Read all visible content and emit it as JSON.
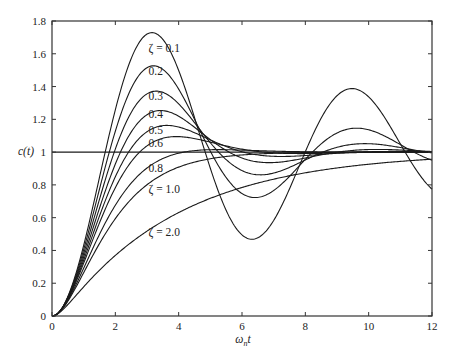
{
  "chart_data": {
    "type": "line",
    "title": "",
    "xlabel": "ωₙt",
    "ylabel": "c(t)",
    "xlim": [
      0,
      12
    ],
    "ylim": [
      0,
      1.8
    ],
    "grid": false,
    "legend": "inline labels on curves",
    "x_ticks": [
      "0",
      "2",
      "4",
      "6",
      "8",
      "10",
      "12"
    ],
    "y_ticks": [
      "0",
      "0.2",
      "0.4",
      "0.6",
      "0.8",
      "1",
      "1.2",
      "1.4",
      "1.6",
      "1.8"
    ],
    "reference_line": {
      "y": 1.0
    },
    "x": [
      0,
      1,
      2,
      3,
      4,
      5,
      6,
      7,
      8,
      9,
      10,
      11,
      12
    ],
    "series": [
      {
        "name": "ζ = 0.1",
        "zeta": 0.1,
        "label": "ζ = 0.1",
        "values": [
          0,
          0.431,
          1.258,
          1.72,
          1.499,
          0.902,
          0.494,
          0.581,
          0.997,
          1.341,
          1.339,
          1.052,
          0.774
        ]
      },
      {
        "name": "ζ = 0.2",
        "zeta": 0.2,
        "label": "0.2",
        "values": [
          0,
          0.405,
          1.128,
          1.516,
          1.385,
          1.005,
          0.747,
          0.766,
          0.957,
          1.117,
          1.136,
          1.046,
          0.95
        ]
      },
      {
        "name": "ζ = 0.3",
        "zeta": 0.3,
        "label": "0.3",
        "values": [
          0,
          0.382,
          1.018,
          1.355,
          1.295,
          1.057,
          0.888,
          0.873,
          0.952,
          1.03,
          1.051,
          1.027,
          0.995
        ]
      },
      {
        "name": "ζ = 0.4",
        "zeta": 0.4,
        "label": "0.4",
        "values": [
          0,
          0.36,
          0.927,
          1.228,
          1.219,
          1.075,
          0.964,
          0.937,
          0.964,
          0.999,
          1.016,
          1.013,
          1.004
        ]
      },
      {
        "name": "ζ = 0.5",
        "zeta": 0.5,
        "label": "0.5",
        "values": [
          0,
          0.34,
          0.849,
          1.125,
          1.153,
          1.075,
          1.002,
          0.974,
          0.979,
          0.993,
          1.002,
          1.003,
          1.001
        ]
      },
      {
        "name": "ζ = 0.6",
        "zeta": 0.6,
        "label": "0.6",
        "values": [
          0,
          0.322,
          0.784,
          1.038,
          1.095,
          1.061,
          1.018,
          0.995,
          0.991,
          0.995,
          1.0,
          1.001,
          1.0
        ]
      },
      {
        "name": "ζ = 0.8",
        "zeta": 0.8,
        "label": "0.8",
        "values": [
          0,
          0.291,
          0.675,
          0.903,
          0.993,
          1.015,
          1.012,
          1.005,
          1.001,
          1.0,
          1.0,
          1.0,
          1.0
        ]
      },
      {
        "name": "ζ = 1.0",
        "zeta": 1.0,
        "label": "ζ = 1.0",
        "values": [
          0,
          0.264,
          0.594,
          0.801,
          0.908,
          0.96,
          0.983,
          0.993,
          0.997,
          0.999,
          1.0,
          1.0,
          1.0
        ]
      },
      {
        "name": "ζ = 2.0",
        "zeta": 2.0,
        "label": "ζ = 2.0",
        "values": [
          0,
          0.178,
          0.37,
          0.517,
          0.63,
          0.718,
          0.785,
          0.835,
          0.874,
          0.903,
          0.926,
          0.943,
          0.957
        ]
      }
    ],
    "curve_labels": [
      {
        "text": "ζ = 0.1",
        "x": 3.05,
        "y": 1.61
      },
      {
        "text": "0.2",
        "x": 3.05,
        "y": 1.47
      },
      {
        "text": "0.3",
        "x": 3.05,
        "y": 1.32
      },
      {
        "text": "0.4",
        "x": 3.05,
        "y": 1.21
      },
      {
        "text": "0.5",
        "x": 3.05,
        "y": 1.11
      },
      {
        "text": "0.6",
        "x": 3.05,
        "y": 1.03
      },
      {
        "text": "0.8",
        "x": 3.05,
        "y": 0.88
      },
      {
        "text": "ζ = 1.0",
        "x": 3.05,
        "y": 0.75
      },
      {
        "text": "ζ = 2.0",
        "x": 3.05,
        "y": 0.49
      }
    ]
  }
}
